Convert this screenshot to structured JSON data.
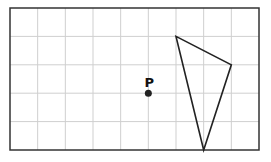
{
  "grid": {
    "columns": 9,
    "rows": 5
  },
  "point": {
    "label": "P",
    "col": 5,
    "row": 3
  },
  "triangle": {
    "vertices": [
      [
        6,
        1
      ],
      [
        8,
        2
      ],
      [
        7,
        5
      ]
    ]
  },
  "colors": {
    "grid": "#cfcfcf",
    "border": "#333333",
    "shape": "#222222"
  }
}
